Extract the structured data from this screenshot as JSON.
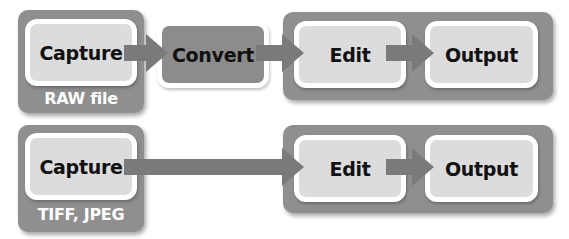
{
  "rows": [
    {
      "source": {
        "box_label": "Capture",
        "format_label": "RAW file"
      },
      "convert": {
        "box_label": "Convert"
      },
      "edit": {
        "box_label": "Edit"
      },
      "output": {
        "box_label": "Output"
      }
    },
    {
      "source": {
        "box_label": "Capture",
        "format_label": "TIFF, JPEG"
      },
      "edit": {
        "box_label": "Edit"
      },
      "output": {
        "box_label": "Output"
      }
    }
  ],
  "colors": {
    "container": "#8f8f8f",
    "box_light": "#dcdcdc",
    "box_dark": "#8c8c8c",
    "arrow": "#7a7a7a",
    "label_text": "#111111",
    "format_text": "#ffffff"
  }
}
